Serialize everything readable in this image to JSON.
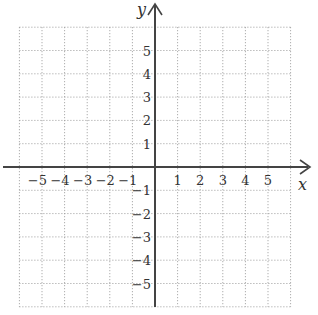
{
  "chart_data": {
    "type": "coordinate-grid",
    "title": "",
    "xlabel": "x",
    "ylabel": "y",
    "x_range": [
      -6,
      6
    ],
    "y_range": [
      -6,
      6
    ],
    "grid": "dotted",
    "x_tick_labels": [
      "-5",
      "-4",
      "-3",
      "-2",
      "-1",
      "1",
      "2",
      "3",
      "4",
      "5"
    ],
    "y_tick_labels": [
      "5",
      "4",
      "3",
      "2",
      "1",
      "-1",
      "-2",
      "-3",
      "-4",
      "-5"
    ],
    "data_points": []
  },
  "labels": {
    "x_axis": "x",
    "y_axis": "y",
    "x_ticks": [
      {
        "value": -5,
        "text": "−5"
      },
      {
        "value": -4,
        "text": "−4"
      },
      {
        "value": -3,
        "text": "−3"
      },
      {
        "value": -2,
        "text": "−2"
      },
      {
        "value": -1,
        "text": "−1"
      },
      {
        "value": 1,
        "text": "1"
      },
      {
        "value": 2,
        "text": "2"
      },
      {
        "value": 3,
        "text": "3"
      },
      {
        "value": 4,
        "text": "4"
      },
      {
        "value": 5,
        "text": "5"
      }
    ],
    "y_ticks": [
      {
        "value": 5,
        "text": "5"
      },
      {
        "value": 4,
        "text": "4"
      },
      {
        "value": 3,
        "text": "3"
      },
      {
        "value": 2,
        "text": "2"
      },
      {
        "value": 1,
        "text": "1"
      },
      {
        "value": -1,
        "text": "−1"
      },
      {
        "value": -2,
        "text": "−2"
      },
      {
        "value": -3,
        "text": "−3"
      },
      {
        "value": -4,
        "text": "−4"
      },
      {
        "value": -5,
        "text": "−5"
      }
    ]
  },
  "colors": {
    "axis": "#444444",
    "grid": "#9a9a9a",
    "text": "#333333",
    "background": "#ffffff"
  }
}
